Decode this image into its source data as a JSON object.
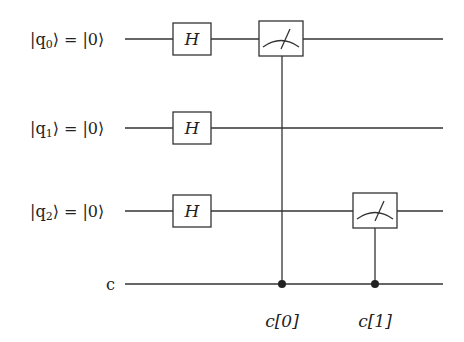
{
  "circuit": {
    "qubits": [
      {
        "label_ket": "|q",
        "sub": "0",
        "init": "⟩ = |0⟩"
      },
      {
        "label_ket": "|q",
        "sub": "1",
        "init": "⟩ = |0⟩"
      },
      {
        "label_ket": "|q",
        "sub": "2",
        "init": "⟩ = |0⟩"
      }
    ],
    "classical_label": "c",
    "gates": [
      {
        "type": "H",
        "label": "H",
        "qubit": 0
      },
      {
        "type": "H",
        "label": "H",
        "qubit": 1
      },
      {
        "type": "H",
        "label": "H",
        "qubit": 2
      }
    ],
    "measurements": [
      {
        "qubit": 0,
        "target_label": "c[0]"
      },
      {
        "qubit": 2,
        "target_label": "c[1]"
      }
    ]
  }
}
